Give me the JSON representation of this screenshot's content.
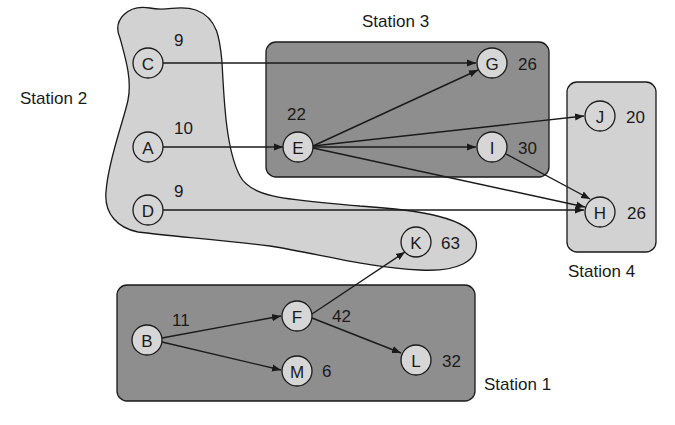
{
  "diagram": {
    "type": "precedence-diagram-with-stations",
    "colors": {
      "light_station": "#d2d2d2",
      "dark_station": "#8e8e8e",
      "node_fill": "#d6d6d6",
      "stroke": "#1a1a1a",
      "background": "#ffffff"
    },
    "stations": [
      {
        "id": "s1",
        "label": "Station 1",
        "tasks": [
          "B",
          "F",
          "M",
          "L"
        ]
      },
      {
        "id": "s2",
        "label": "Station 2",
        "tasks": [
          "C",
          "A",
          "D",
          "K"
        ]
      },
      {
        "id": "s3",
        "label": "Station 3",
        "tasks": [
          "E",
          "G",
          "I"
        ]
      },
      {
        "id": "s4",
        "label": "Station 4",
        "tasks": [
          "J",
          "H"
        ]
      }
    ],
    "nodes": [
      {
        "id": "C",
        "label": "C",
        "time": "9"
      },
      {
        "id": "A",
        "label": "A",
        "time": "10"
      },
      {
        "id": "D",
        "label": "D",
        "time": "9"
      },
      {
        "id": "K",
        "label": "K",
        "time": "63"
      },
      {
        "id": "E",
        "label": "E",
        "time": "22"
      },
      {
        "id": "G",
        "label": "G",
        "time": "26"
      },
      {
        "id": "I",
        "label": "I",
        "time": "30"
      },
      {
        "id": "J",
        "label": "J",
        "time": "20"
      },
      {
        "id": "H",
        "label": "H",
        "time": "26"
      },
      {
        "id": "B",
        "label": "B",
        "time": "11"
      },
      {
        "id": "F",
        "label": "F",
        "time": "42"
      },
      {
        "id": "M",
        "label": "M",
        "time": "6"
      },
      {
        "id": "L",
        "label": "L",
        "time": "32"
      }
    ],
    "edges": [
      {
        "from": "C",
        "to": "G"
      },
      {
        "from": "A",
        "to": "E"
      },
      {
        "from": "D",
        "to": "H"
      },
      {
        "from": "E",
        "to": "G"
      },
      {
        "from": "E",
        "to": "J"
      },
      {
        "from": "E",
        "to": "I"
      },
      {
        "from": "E",
        "to": "H"
      },
      {
        "from": "I",
        "to": "H"
      },
      {
        "from": "B",
        "to": "F"
      },
      {
        "from": "B",
        "to": "M"
      },
      {
        "from": "F",
        "to": "K"
      },
      {
        "from": "F",
        "to": "L"
      }
    ]
  }
}
